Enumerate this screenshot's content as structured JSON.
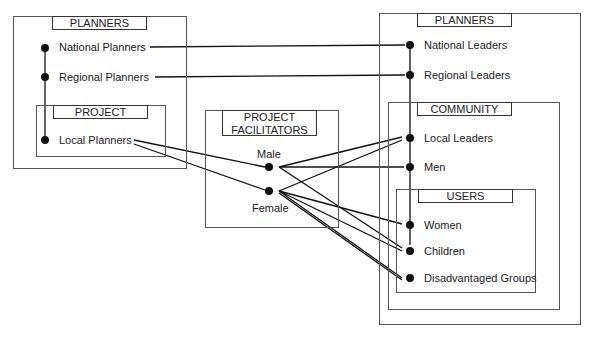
{
  "left_group": {
    "title": "PLANNERS",
    "nodes": [
      "National Planners",
      "Regional Planners"
    ],
    "sub_group": {
      "title": "PROJECT",
      "nodes": [
        "Local Planners"
      ]
    }
  },
  "middle_group": {
    "title_line1": "PROJECT",
    "title_line2": "FACILITATORS",
    "nodes": [
      "Male",
      "Female"
    ]
  },
  "right_group": {
    "title": "PLANNERS",
    "nodes": [
      "National Leaders",
      "Regional Leaders"
    ],
    "community": {
      "title": "COMMUNITY",
      "nodes": [
        "Local Leaders",
        "Men"
      ],
      "users": {
        "title": "USERS",
        "nodes": [
          "Women",
          "Children",
          "Disadvantaged Groups"
        ]
      }
    }
  },
  "connections": [
    [
      "National Planners",
      "National Leaders"
    ],
    [
      "Regional Planners",
      "Regional Leaders"
    ],
    [
      "Local Planners",
      "Male"
    ],
    [
      "Local Planners",
      "Female"
    ],
    [
      "Male",
      "Local Leaders"
    ],
    [
      "Male",
      "Men"
    ],
    [
      "Male",
      "Disadvantaged Groups"
    ],
    [
      "Female",
      "Local Leaders"
    ],
    [
      "Female",
      "Women"
    ],
    [
      "Female",
      "Children"
    ],
    [
      "Female",
      "Disadvantaged Groups"
    ]
  ]
}
